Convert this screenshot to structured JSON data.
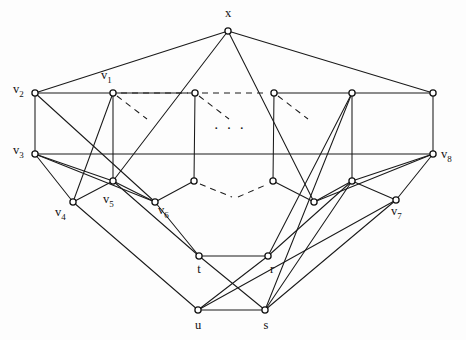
{
  "figure": {
    "background_color": "#fdfdfd",
    "line_color": "#1a1a1a",
    "node_fill": "#ffffff",
    "width": 466,
    "height": 340,
    "ellipsis_top": "· · ·",
    "ellipsis_mid": "· · ·"
  },
  "nodes": [
    {
      "id": "x",
      "label": "x",
      "sub": "",
      "x": 228,
      "y": 31,
      "lx": 228,
      "ly": 17,
      "anchor": "middle",
      "labeled": true
    },
    {
      "id": "v2",
      "label": "v",
      "sub": "2",
      "x": 35,
      "y": 93,
      "lx": 13,
      "ly": 93,
      "anchor": "start",
      "labeled": true
    },
    {
      "id": "v1",
      "label": "v",
      "sub": "1",
      "x": 113,
      "y": 93,
      "lx": 101,
      "ly": 79,
      "anchor": "start",
      "labeled": true
    },
    {
      "id": "a3",
      "label": "",
      "sub": "",
      "x": 195,
      "y": 93,
      "lx": 0,
      "ly": 0,
      "anchor": "start",
      "labeled": false
    },
    {
      "id": "a4",
      "label": "",
      "sub": "",
      "x": 274,
      "y": 93,
      "lx": 0,
      "ly": 0,
      "anchor": "start",
      "labeled": false
    },
    {
      "id": "a5",
      "label": "",
      "sub": "",
      "x": 352,
      "y": 93,
      "lx": 0,
      "ly": 0,
      "anchor": "start",
      "labeled": false
    },
    {
      "id": "a6",
      "label": "",
      "sub": "",
      "x": 433,
      "y": 93,
      "lx": 0,
      "ly": 0,
      "anchor": "start",
      "labeled": false
    },
    {
      "id": "v3",
      "label": "v",
      "sub": "3",
      "x": 35,
      "y": 154,
      "lx": 13,
      "ly": 154,
      "anchor": "start",
      "labeled": true
    },
    {
      "id": "v8",
      "label": "v",
      "sub": "8",
      "x": 433,
      "y": 154,
      "lx": 441,
      "ly": 158,
      "anchor": "start",
      "labeled": true
    },
    {
      "id": "v5",
      "label": "v",
      "sub": "5",
      "x": 113,
      "y": 181,
      "lx": 103,
      "ly": 203,
      "anchor": "start",
      "labeled": true
    },
    {
      "id": "b3",
      "label": "",
      "sub": "",
      "x": 194,
      "y": 181,
      "lx": 0,
      "ly": 0,
      "anchor": "start",
      "labeled": false
    },
    {
      "id": "b4",
      "label": "",
      "sub": "",
      "x": 273,
      "y": 181,
      "lx": 0,
      "ly": 0,
      "anchor": "start",
      "labeled": false
    },
    {
      "id": "b5",
      "label": "",
      "sub": "",
      "x": 352,
      "y": 181,
      "lx": 0,
      "ly": 0,
      "anchor": "start",
      "labeled": false
    },
    {
      "id": "v4",
      "label": "v",
      "sub": "4",
      "x": 73,
      "y": 202,
      "lx": 55,
      "ly": 216,
      "anchor": "start",
      "labeled": true
    },
    {
      "id": "v6",
      "label": "v",
      "sub": "6",
      "x": 155,
      "y": 202,
      "lx": 158,
      "ly": 214,
      "anchor": "start",
      "labeled": true
    },
    {
      "id": "c4",
      "label": "",
      "sub": "",
      "x": 314,
      "y": 202,
      "lx": 0,
      "ly": 0,
      "anchor": "start",
      "labeled": false
    },
    {
      "id": "v7",
      "label": "v",
      "sub": "7",
      "x": 396,
      "y": 200,
      "lx": 391,
      "ly": 215,
      "anchor": "start",
      "labeled": true
    },
    {
      "id": "t",
      "label": "t",
      "sub": "",
      "x": 199,
      "y": 256,
      "lx": 199,
      "ly": 273,
      "anchor": "middle",
      "labeled": true
    },
    {
      "id": "r",
      "label": "r",
      "sub": "",
      "x": 268,
      "y": 256,
      "lx": 272,
      "ly": 273,
      "anchor": "middle",
      "labeled": true
    },
    {
      "id": "u",
      "label": "u",
      "sub": "",
      "x": 198,
      "y": 310,
      "lx": 198,
      "ly": 329,
      "anchor": "middle",
      "labeled": true
    },
    {
      "id": "s",
      "label": "s",
      "sub": "",
      "x": 265,
      "y": 310,
      "lx": 266,
      "ly": 329,
      "anchor": "middle",
      "labeled": true
    }
  ],
  "edges_solid": [
    [
      "x",
      "v2"
    ],
    [
      "x",
      "a6"
    ],
    [
      "x",
      "v5"
    ],
    [
      "x",
      "c4"
    ],
    [
      "v2",
      "v1"
    ],
    [
      "v1",
      "a3"
    ],
    [
      "a4",
      "a5"
    ],
    [
      "a5",
      "a6"
    ],
    [
      "v2",
      "v3"
    ],
    [
      "a6",
      "v8"
    ],
    [
      "v3",
      "v8"
    ],
    [
      "v1",
      "v5"
    ],
    [
      "a3",
      "b3"
    ],
    [
      "a4",
      "b4"
    ],
    [
      "a5",
      "b5"
    ],
    [
      "v2",
      "v6"
    ],
    [
      "v3",
      "v4"
    ],
    [
      "v3",
      "v5"
    ],
    [
      "v3",
      "v6"
    ],
    [
      "v1",
      "v4"
    ],
    [
      "v5",
      "v4"
    ],
    [
      "v5",
      "v6"
    ],
    [
      "b3",
      "v6"
    ],
    [
      "b4",
      "c4"
    ],
    [
      "b5",
      "c4"
    ],
    [
      "b5",
      "v7"
    ],
    [
      "v8",
      "v7"
    ],
    [
      "v8",
      "c4"
    ],
    [
      "v8",
      "b5"
    ],
    [
      "v4",
      "u"
    ],
    [
      "v5",
      "t"
    ],
    [
      "v6",
      "t"
    ],
    [
      "t",
      "r"
    ],
    [
      "u",
      "s"
    ],
    [
      "t",
      "s"
    ],
    [
      "r",
      "u"
    ],
    [
      "s",
      "b5"
    ],
    [
      "s",
      "v7"
    ],
    [
      "s",
      "a5"
    ],
    [
      "r",
      "a5"
    ],
    [
      "r",
      "b5"
    ],
    [
      "u",
      "v7"
    ]
  ],
  "edges_dashed": [
    {
      "from": "v1",
      "dx": 34,
      "dy": 26
    },
    {
      "from": "a3",
      "dx": 34,
      "dy": 26
    },
    {
      "from": "a4",
      "dx": 34,
      "dy": 26
    }
  ],
  "dashes_top_row": [
    {
      "x1": 121,
      "y1": 93,
      "x2": 188,
      "y2": 93
    },
    {
      "x1": 202,
      "y1": 93,
      "x2": 267,
      "y2": 93
    }
  ],
  "dashes_third_row": [
    {
      "x1": 200,
      "y1": 184,
      "x2": 232,
      "y2": 197
    },
    {
      "x1": 238,
      "y1": 197,
      "x2": 268,
      "y2": 184
    }
  ],
  "ellipsis_positions": {
    "top": {
      "x": 230,
      "y": 133
    }
  }
}
